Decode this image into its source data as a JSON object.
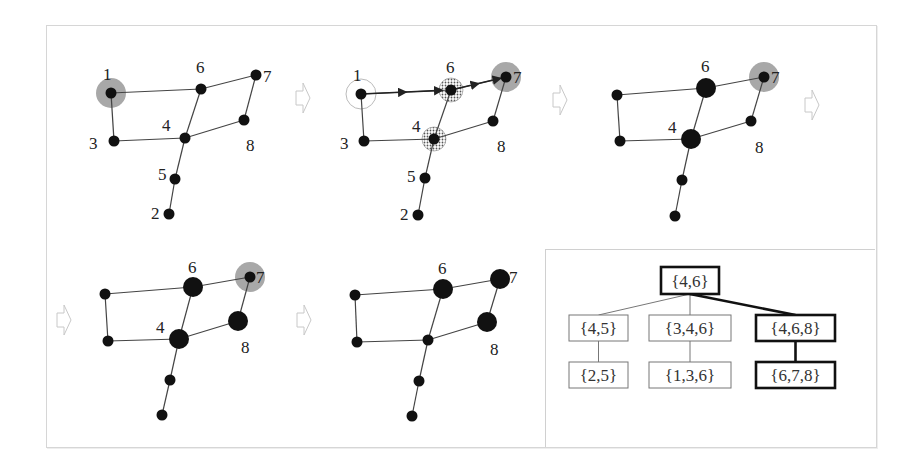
{
  "figure": {
    "colors": {
      "node": "#111111",
      "edge": "#444444",
      "highlight_fill": "#a8a8a8",
      "arrow_outline": "#c8c8c8",
      "box_border_thin": "#777777",
      "box_border_bold": "#111111"
    },
    "graph": {
      "edges": [
        [
          "1",
          "6"
        ],
        [
          "6",
          "7"
        ],
        [
          "1",
          "3"
        ],
        [
          "3",
          "4"
        ],
        [
          "4",
          "6"
        ],
        [
          "4",
          "8"
        ],
        [
          "8",
          "7"
        ],
        [
          "4",
          "5"
        ],
        [
          "5",
          "2"
        ]
      ]
    },
    "panels": [
      {
        "id": "p1",
        "nodes": {
          "1": [
            111,
            93
          ],
          "6": [
            201,
            89
          ],
          "7": [
            256,
            75
          ],
          "3": [
            114,
            141
          ],
          "4": [
            185,
            138
          ],
          "8": [
            244,
            120
          ],
          "5": [
            175,
            179
          ],
          "2": [
            169,
            214
          ]
        },
        "labels": [
          {
            "text": "1",
            "x": 103,
            "y": 80
          },
          {
            "text": "6",
            "x": 196,
            "y": 73
          },
          {
            "text": "7",
            "x": 263,
            "y": 82
          },
          {
            "text": "3",
            "x": 89,
            "y": 149
          },
          {
            "text": "4",
            "x": 162,
            "y": 131
          },
          {
            "text": "8",
            "x": 246,
            "y": 151
          },
          {
            "text": "5",
            "x": 158,
            "y": 180
          },
          {
            "text": "2",
            "x": 151,
            "y": 219
          }
        ],
        "highlight": [
          "1"
        ],
        "big": [],
        "hatched": [],
        "hollow": []
      },
      {
        "id": "p2",
        "nodes": {
          "1": [
            361,
            94
          ],
          "6": [
            451,
            90
          ],
          "7": [
            506,
            77
          ],
          "3": [
            364,
            141
          ],
          "4": [
            434,
            139
          ],
          "8": [
            493,
            121
          ],
          "5": [
            425,
            178
          ],
          "2": [
            418,
            215
          ]
        },
        "labels": [
          {
            "text": "1",
            "x": 353,
            "y": 81
          },
          {
            "text": "6",
            "x": 446,
            "y": 73
          },
          {
            "text": "7",
            "x": 513,
            "y": 83
          },
          {
            "text": "3",
            "x": 340,
            "y": 149
          },
          {
            "text": "4",
            "x": 412,
            "y": 132
          },
          {
            "text": "8",
            "x": 497,
            "y": 152
          },
          {
            "text": "5",
            "x": 407,
            "y": 182
          },
          {
            "text": "2",
            "x": 400,
            "y": 220
          }
        ],
        "highlight": [
          "7"
        ],
        "big": [],
        "hatched": [
          "6",
          "4"
        ],
        "hollow": [
          "1"
        ],
        "flow_arrows": [
          [
            [
              "1"
            ],
            [
              "6"
            ]
          ],
          [
            [
              "6"
            ],
            [
              "7"
            ]
          ]
        ]
      },
      {
        "id": "p3",
        "nodes": {
          "1": [
            617,
            95
          ],
          "6": [
            706,
            88
          ],
          "7": [
            764,
            77
          ],
          "3": [
            620,
            141
          ],
          "4": [
            691,
            139
          ],
          "8": [
            751,
            121
          ],
          "5": [
            682,
            180
          ],
          "2": [
            675,
            216
          ]
        },
        "labels": [
          {
            "text": "6",
            "x": 701,
            "y": 72
          },
          {
            "text": "7",
            "x": 771,
            "y": 83
          },
          {
            "text": "4",
            "x": 668,
            "y": 133
          },
          {
            "text": "8",
            "x": 755,
            "y": 153
          }
        ],
        "highlight": [
          "7"
        ],
        "big": [
          "6",
          "4"
        ],
        "hatched": [],
        "hollow": []
      },
      {
        "id": "p4",
        "nodes": {
          "1": [
            105,
            294
          ],
          "6": [
            193,
            287
          ],
          "7": [
            250,
            277
          ],
          "3": [
            108,
            341
          ],
          "4": [
            179,
            339
          ],
          "8": [
            238,
            321
          ],
          "5": [
            170,
            380
          ],
          "2": [
            162,
            415
          ]
        },
        "labels": [
          {
            "text": "6",
            "x": 188,
            "y": 273
          },
          {
            "text": "7",
            "x": 256,
            "y": 283
          },
          {
            "text": "4",
            "x": 156,
            "y": 333
          },
          {
            "text": "8",
            "x": 241,
            "y": 353
          }
        ],
        "highlight": [
          "7"
        ],
        "big": [
          "6",
          "4",
          "8"
        ],
        "hatched": [],
        "hollow": []
      },
      {
        "id": "p5",
        "nodes": {
          "1": [
            355,
            295
          ],
          "6": [
            443,
            289
          ],
          "7": [
            500,
            279
          ],
          "3": [
            357,
            342
          ],
          "4": [
            428,
            340
          ],
          "8": [
            487,
            322
          ],
          "5": [
            419,
            381
          ],
          "2": [
            412,
            416
          ]
        },
        "labels": [
          {
            "text": "6",
            "x": 438,
            "y": 274
          },
          {
            "text": "7",
            "x": 509,
            "y": 283
          },
          {
            "text": "8",
            "x": 490,
            "y": 355
          }
        ],
        "highlight": [],
        "big": [
          "6",
          "7",
          "8"
        ],
        "hatched": [],
        "hollow": []
      }
    ],
    "step_arrows": [
      {
        "x": 296,
        "y": 83
      },
      {
        "x": 553,
        "y": 85
      },
      {
        "x": 805,
        "y": 90
      },
      {
        "x": 57,
        "y": 305
      },
      {
        "x": 297,
        "y": 305
      }
    ],
    "tree": {
      "nodes": [
        {
          "id": "r",
          "label": "{4,6}",
          "x": 661,
          "y": 267,
          "w": 58,
          "h": 27,
          "bold": true
        },
        {
          "id": "a",
          "label": "{4,5}",
          "x": 569,
          "y": 315,
          "w": 59,
          "h": 26,
          "bold": false
        },
        {
          "id": "b",
          "label": "{3,4,6}",
          "x": 649,
          "y": 315,
          "w": 82,
          "h": 26,
          "bold": false
        },
        {
          "id": "c",
          "label": "{4,6,8}",
          "x": 756,
          "y": 315,
          "w": 79,
          "h": 26,
          "bold": true
        },
        {
          "id": "a2",
          "label": "{2,5}",
          "x": 569,
          "y": 362,
          "w": 59,
          "h": 26,
          "bold": false
        },
        {
          "id": "b2",
          "label": "{1,3,6}",
          "x": 649,
          "y": 362,
          "w": 82,
          "h": 26,
          "bold": false
        },
        {
          "id": "c2",
          "label": "{6,7,8}",
          "x": 756,
          "y": 362,
          "w": 79,
          "h": 26,
          "bold": true
        }
      ],
      "edges": [
        {
          "from": "r",
          "to": "a",
          "bold": false
        },
        {
          "from": "r",
          "to": "b",
          "bold": false
        },
        {
          "from": "r",
          "to": "c",
          "bold": true
        },
        {
          "from": "a",
          "to": "a2",
          "bold": false
        },
        {
          "from": "b",
          "to": "b2",
          "bold": false
        },
        {
          "from": "c",
          "to": "c2",
          "bold": true
        }
      ]
    }
  }
}
